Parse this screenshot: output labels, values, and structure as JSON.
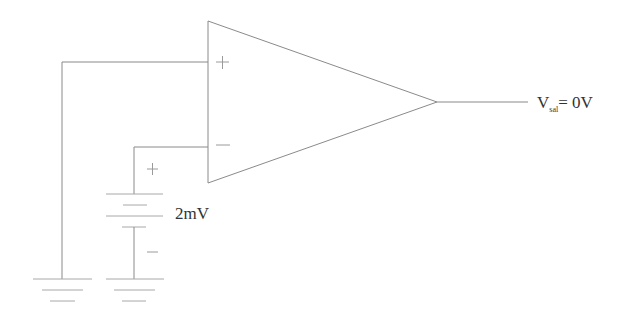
{
  "diagram": {
    "type": "circuit",
    "title": "",
    "components": {
      "opamp": {
        "kind": "operational-amplifier",
        "non_inverting_sign": "+",
        "inverting_sign": "−"
      },
      "battery": {
        "kind": "dc-voltage-source",
        "value_label": "2mV",
        "positive_sign": "+",
        "negative_sign": "−"
      },
      "grounds": [
        {
          "kind": "ground",
          "connected_to": "non-inverting-input"
        },
        {
          "kind": "ground",
          "connected_to": "battery-negative"
        }
      ]
    },
    "output": {
      "label_main": "V",
      "label_sub": "sal",
      "label_rest": "= 0V"
    },
    "connections": [
      {
        "from": "non-inverting-input",
        "to": "ground-1"
      },
      {
        "from": "inverting-input",
        "to": "battery-positive"
      },
      {
        "from": "battery-negative",
        "to": "ground-2"
      },
      {
        "from": "opamp-output",
        "to": "output-label"
      }
    ]
  }
}
